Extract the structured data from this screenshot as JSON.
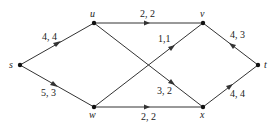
{
  "diagram": {
    "type": "flow-network",
    "nodes": [
      {
        "id": "s",
        "label": "s",
        "x": 20,
        "y": 65
      },
      {
        "id": "u",
        "label": "u",
        "x": 94,
        "y": 23
      },
      {
        "id": "w",
        "label": "w",
        "x": 94,
        "y": 107
      },
      {
        "id": "v",
        "label": "v",
        "x": 203,
        "y": 23
      },
      {
        "id": "x",
        "label": "x",
        "x": 203,
        "y": 107
      },
      {
        "id": "t",
        "label": "t",
        "x": 258,
        "y": 65
      }
    ],
    "edges": [
      {
        "from": "s",
        "to": "u",
        "label": "4, 4"
      },
      {
        "from": "s",
        "to": "w",
        "label": "5, 3"
      },
      {
        "from": "u",
        "to": "v",
        "label": "2, 2"
      },
      {
        "from": "w",
        "to": "v",
        "label": "1,1"
      },
      {
        "from": "u",
        "to": "x",
        "label": "3, 2"
      },
      {
        "from": "w",
        "to": "x",
        "label": "2, 2"
      },
      {
        "from": "v",
        "to": "t",
        "label": "4, 3"
      },
      {
        "from": "x",
        "to": "t",
        "label": "4, 4"
      }
    ],
    "colors": {
      "line": "#333333",
      "node": "#111111"
    }
  }
}
